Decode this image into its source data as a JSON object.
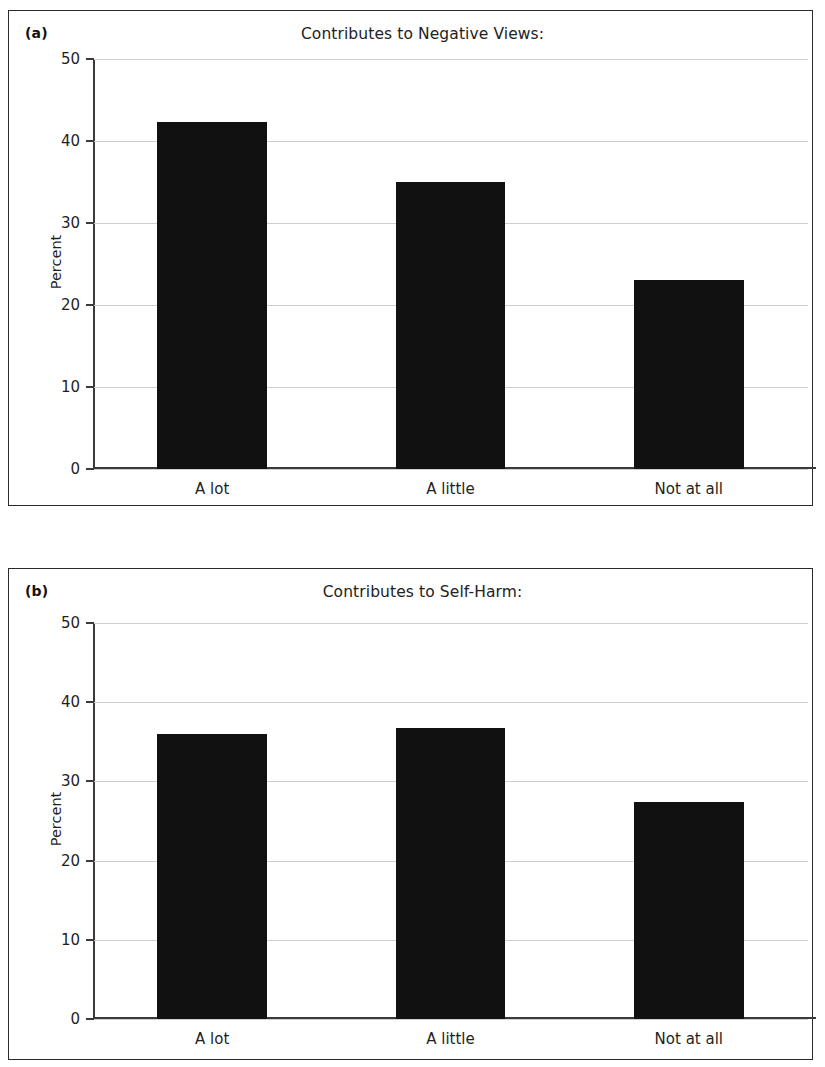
{
  "figure": {
    "background": "#ffffff",
    "bar_color": "#111111",
    "axis_color": "#3a3a3a",
    "gridline_color": "#cfcfcf"
  },
  "panels": [
    {
      "letter": "(a)",
      "title": "Contributes to Negative Views:",
      "ylabel": "Percent"
    },
    {
      "letter": "(b)",
      "title": "Contributes to Self-Harm:",
      "ylabel": "Percent"
    }
  ],
  "chart_data": [
    {
      "type": "bar",
      "title": "Contributes to Negative Views:",
      "panel": "(a)",
      "categories": [
        "A lot",
        "A little",
        "Not at all"
      ],
      "values": [
        42.3,
        35.0,
        23.0
      ],
      "xlabel": "",
      "ylabel": "Percent",
      "ylim": [
        0,
        50
      ],
      "yticks": [
        0,
        10,
        20,
        30,
        40,
        50
      ],
      "ytick_labels": [
        "0",
        "10",
        "20",
        "30",
        "40",
        "50"
      ],
      "grid": true,
      "legend": false,
      "bar_color": "#111111"
    },
    {
      "type": "bar",
      "title": "Contributes to Self-Harm:",
      "panel": "(b)",
      "categories": [
        "A lot",
        "A little",
        "Not at all"
      ],
      "values": [
        36.0,
        36.8,
        27.4
      ],
      "xlabel": "",
      "ylabel": "Percent",
      "ylim": [
        0,
        50
      ],
      "yticks": [
        0,
        10,
        20,
        30,
        40,
        50
      ],
      "ytick_labels": [
        "0",
        "10",
        "20",
        "30",
        "40",
        "50"
      ],
      "grid": true,
      "legend": false,
      "bar_color": "#111111"
    }
  ]
}
